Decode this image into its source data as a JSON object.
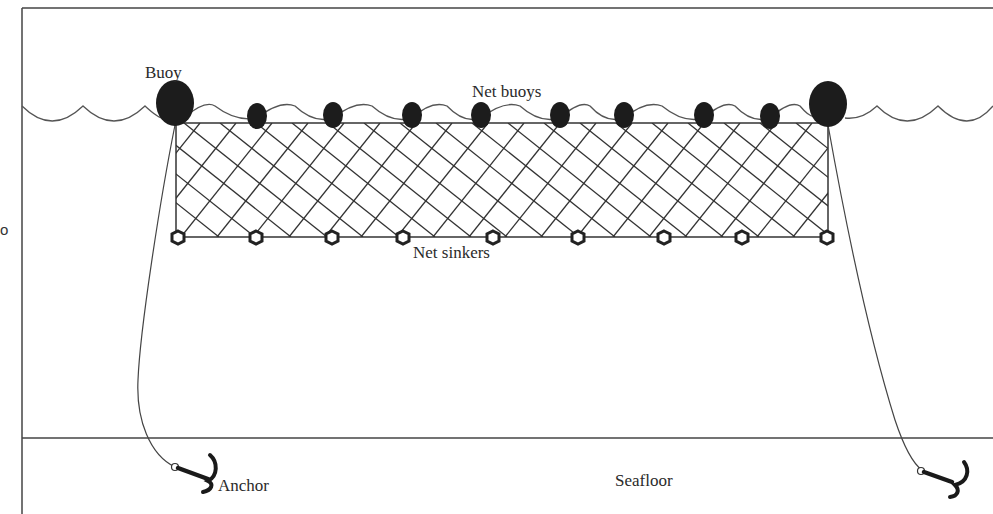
{
  "diagram": {
    "type": "gillnet-schematic",
    "labels": {
      "buoy": "Buoy",
      "net_buoys": "Net buoys",
      "net_sinkers": "Net sinkers",
      "anchor": "Anchor",
      "seafloor": "Seafloor",
      "cropped_left_glyph": "o"
    },
    "colors": {
      "line": "#3a3a3a",
      "buoy_fill": "#1c1c1c",
      "background": "#ffffff"
    },
    "elements": {
      "end_buoys": [
        {
          "cx": 175,
          "cy": 103
        },
        {
          "cx": 828,
          "cy": 104
        }
      ],
      "net_buoys": [
        257,
        333,
        412,
        481,
        560,
        624,
        704,
        770
      ],
      "net_sinkers": [
        178,
        256,
        332,
        403,
        493,
        578,
        664,
        742,
        827
      ],
      "net_rect": {
        "x": 176,
        "y": 123,
        "width": 652,
        "height": 114
      },
      "seafloor_y": 438,
      "water_surface_y": 115
    }
  }
}
